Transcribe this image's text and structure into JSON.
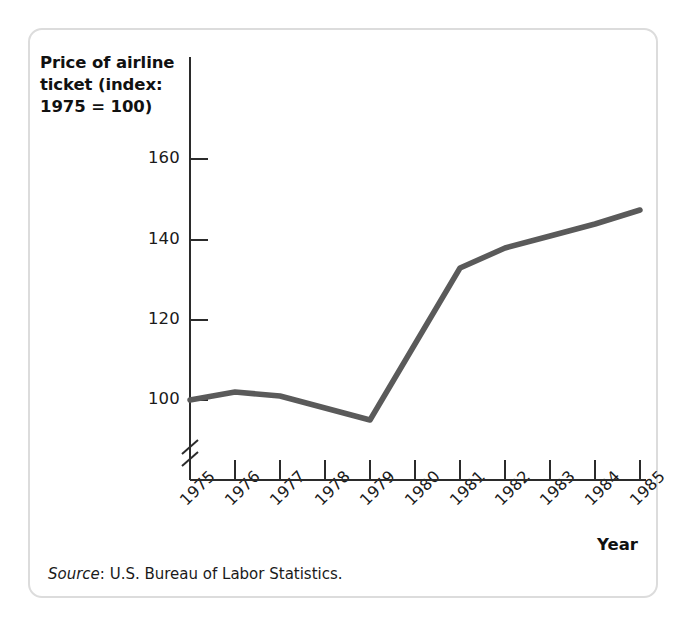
{
  "figure": {
    "source_label": "Source",
    "source_text": ": U.S. Bureau of Labor Statistics.",
    "x_axis_name": "Year"
  },
  "chart_data": {
    "type": "line",
    "title": "",
    "ylabel": "Price of airline ticket (index: 1975 = 100)",
    "ylabel_line1": "Price of airline",
    "ylabel_line2": "ticket (index:",
    "ylabel_line3": "1975 = 100)",
    "xlabel": "Year",
    "categories": [
      "1975",
      "1976",
      "1977",
      "1978",
      "1979",
      "1980",
      "1981",
      "1982",
      "1983",
      "1984",
      "1985"
    ],
    "x": [
      1975,
      1976,
      1977,
      1978,
      1979,
      1980,
      1981,
      1982,
      1983,
      1984,
      1985
    ],
    "values": [
      100,
      102,
      101,
      98,
      95,
      114,
      133,
      138,
      141,
      144,
      147.5
    ],
    "series": [
      {
        "name": "Price of airline ticket (index: 1975 = 100)",
        "values": [
          100,
          102,
          101,
          98,
          95,
          114,
          133,
          138,
          141,
          144,
          147.5
        ]
      }
    ],
    "y_ticks": [
      100,
      120,
      140,
      160
    ],
    "y_tick_labels": [
      "100",
      "120",
      "140",
      "160"
    ],
    "ylim": [
      88,
      168
    ],
    "xlim": [
      1975,
      1985
    ],
    "grid": false,
    "legend": false,
    "legend_position": "none",
    "axis_break": true,
    "axis_break_note": "y-axis broken below 100",
    "line_color": "#5a5a5a",
    "axis_color": "#2b2b2b",
    "frame_color": "#dcdcdc",
    "source": "U.S. Bureau of Labor Statistics."
  }
}
